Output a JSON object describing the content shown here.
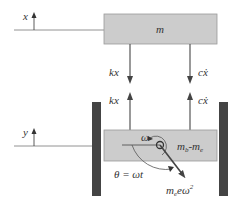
{
  "diagram": {
    "top_mass": {
      "label": "m",
      "coordinate": "x"
    },
    "forces_on_top": [
      {
        "label": "kx"
      },
      {
        "label": "cẋ"
      }
    ],
    "forces_on_bottom": [
      {
        "label": "kx"
      },
      {
        "label": "cẋ"
      }
    ],
    "bottom_mass": {
      "label": "m",
      "sub_b": "b",
      "minus": "-m",
      "sub_e": "e",
      "coordinate": "y"
    },
    "rotation": {
      "omega": "ω",
      "angle_eq": "θ = ωt"
    },
    "centrifugal_force": {
      "m": "m",
      "sub_e": "e",
      "rest": "eω",
      "sup": "2"
    },
    "colors": {
      "box_fill": "#cccccc",
      "box_stroke": "#888888",
      "wall": "#444444",
      "arrow": "#444444",
      "line": "#777777"
    }
  }
}
